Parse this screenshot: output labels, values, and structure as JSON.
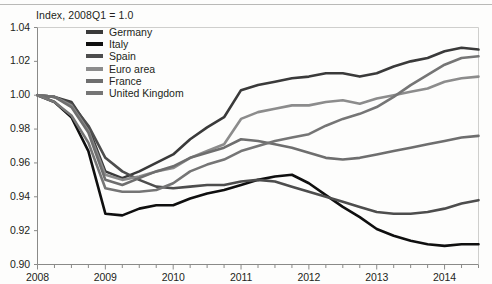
{
  "chart_data": {
    "type": "line",
    "title": "Index, 2008Q1 = 1.0",
    "xlabel": "",
    "ylabel": "",
    "xlim": [
      2008.0,
      2014.5
    ],
    "ylim": [
      0.9,
      1.04
    ],
    "yticks": [
      "1.04",
      "1.02",
      "1.00",
      "0.98",
      "0.96",
      "0.94",
      "0.92",
      "0.90"
    ],
    "ytick_values": [
      1.04,
      1.02,
      1.0,
      0.98,
      0.96,
      0.94,
      0.92,
      0.9
    ],
    "xticks": [
      "2008",
      "2009",
      "2010",
      "2011",
      "2012",
      "2013",
      "2014"
    ],
    "xtick_values": [
      2008,
      2009,
      2010,
      2011,
      2012,
      2013,
      2014
    ],
    "minor_tick_interval": 0.25,
    "grid": false,
    "legend_position": "top-center",
    "x": [
      2008.0,
      2008.25,
      2008.5,
      2008.75,
      2009.0,
      2009.25,
      2009.5,
      2009.75,
      2010.0,
      2010.25,
      2010.5,
      2010.75,
      2011.0,
      2011.25,
      2011.5,
      2011.75,
      2012.0,
      2012.25,
      2012.5,
      2012.75,
      2013.0,
      2013.25,
      2013.5,
      2013.75,
      2014.0,
      2014.25,
      2014.5
    ],
    "series": [
      {
        "name": "Germany",
        "color": "#3a3a3a",
        "values": [
          1.0,
          0.999,
          0.996,
          0.981,
          0.955,
          0.951,
          0.955,
          0.96,
          0.965,
          0.974,
          0.981,
          0.987,
          1.003,
          1.006,
          1.008,
          1.01,
          1.011,
          1.013,
          1.013,
          1.011,
          1.013,
          1.017,
          1.02,
          1.022,
          1.026,
          1.028,
          1.027
        ]
      },
      {
        "name": "Italy",
        "color": "#0f0f0f",
        "values": [
          1.0,
          0.996,
          0.987,
          0.967,
          0.93,
          0.929,
          0.933,
          0.935,
          0.935,
          0.939,
          0.942,
          0.944,
          0.947,
          0.95,
          0.952,
          0.953,
          0.948,
          0.941,
          0.934,
          0.928,
          0.921,
          0.917,
          0.914,
          0.912,
          0.911,
          0.912,
          0.912
        ]
      },
      {
        "name": "Spain",
        "color": "#4d4d4d",
        "values": [
          1.0,
          0.999,
          0.995,
          0.982,
          0.963,
          0.955,
          0.95,
          0.946,
          0.945,
          0.946,
          0.947,
          0.947,
          0.949,
          0.95,
          0.949,
          0.946,
          0.943,
          0.94,
          0.937,
          0.934,
          0.931,
          0.93,
          0.93,
          0.931,
          0.933,
          0.936,
          0.938
        ]
      },
      {
        "name": "Euro area",
        "color": "#8c8c8c",
        "values": [
          1.0,
          0.999,
          0.994,
          0.979,
          0.953,
          0.95,
          0.952,
          0.955,
          0.957,
          0.963,
          0.967,
          0.971,
          0.986,
          0.99,
          0.992,
          0.994,
          0.994,
          0.996,
          0.997,
          0.995,
          0.998,
          1.0,
          1.002,
          1.004,
          1.008,
          1.01,
          1.011
        ]
      },
      {
        "name": "France",
        "color": "#6e6e6e",
        "values": [
          1.0,
          0.999,
          0.993,
          0.978,
          0.95,
          0.947,
          0.951,
          0.955,
          0.958,
          0.963,
          0.966,
          0.969,
          0.974,
          0.973,
          0.971,
          0.969,
          0.966,
          0.963,
          0.962,
          0.963,
          0.965,
          0.967,
          0.969,
          0.971,
          0.973,
          0.975,
          0.976
        ]
      },
      {
        "name": "United Kingdom",
        "color": "#757575",
        "values": [
          1.0,
          0.996,
          0.988,
          0.972,
          0.945,
          0.943,
          0.943,
          0.944,
          0.948,
          0.955,
          0.959,
          0.962,
          0.967,
          0.97,
          0.973,
          0.975,
          0.977,
          0.982,
          0.986,
          0.989,
          0.993,
          0.999,
          1.006,
          1.012,
          1.018,
          1.022,
          1.023
        ]
      }
    ]
  },
  "axes": {
    "frame_color": "#8a8a88",
    "tick_color": "#8a8a88"
  }
}
